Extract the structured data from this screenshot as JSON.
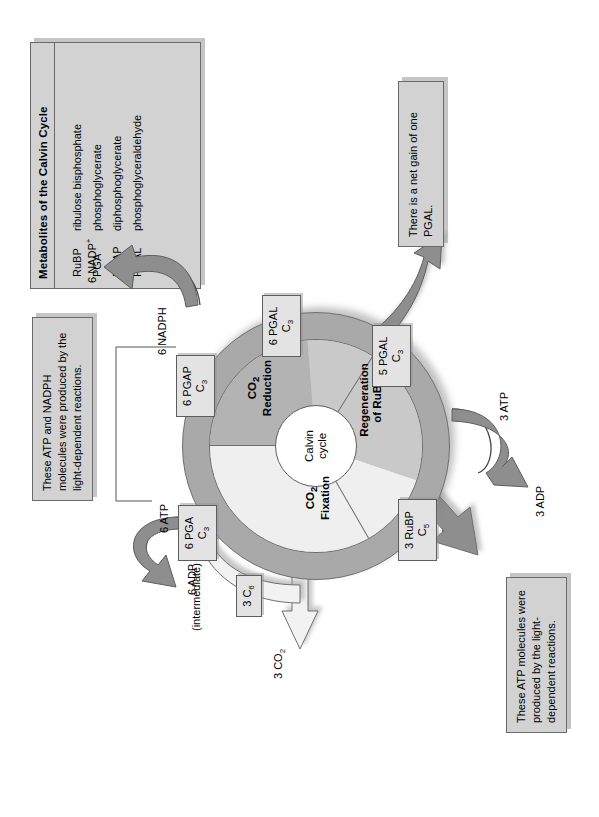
{
  "figure": {
    "kind": "calvin-cycle-diagram",
    "hub_line1": "Calvin",
    "hub_line2": "cycle"
  },
  "legend": {
    "title": "Metabolites of the Calvin Cycle",
    "rows": [
      {
        "abbr": "RuBP",
        "name": "ribulose bisphosphate"
      },
      {
        "abbr": "PGA",
        "name": "phosphoglycerate"
      },
      {
        "abbr": "PGAP",
        "name": "diphosphoglycerate"
      },
      {
        "abbr": "PGAL",
        "name": "phosphoglyceraldehyde"
      }
    ]
  },
  "wedges": {
    "fixation_l1": "CO",
    "fixation_sub": "2",
    "fixation_l2": "Fixation",
    "reduction_l1": "CO",
    "reduction_sub": "2",
    "reduction_l2": "Reduction",
    "regeneration_l1": "Regeneration",
    "regeneration_l2": "of RuBP"
  },
  "boxes": {
    "pga": {
      "line1": "6 PGA",
      "line2": "C",
      "sub": "3"
    },
    "pgap": {
      "line1": "6 PGAP",
      "line2": "C",
      "sub": "3"
    },
    "pgal6": {
      "line1": "6 PGAL",
      "line2": "C",
      "sub": "3"
    },
    "pgal5": {
      "line1": "5 PGAL",
      "line2": "C",
      "sub": "3"
    },
    "rubp": {
      "line1": "3 RuBP",
      "line2": "C",
      "sub": "5"
    },
    "c6": {
      "line1": "3 C",
      "sub": "6"
    }
  },
  "labels": {
    "intermediate": "(intermediate)",
    "co2_in": "3 CO",
    "co2_in_sub": "2",
    "atp6": "6 ATP",
    "adp6": "6 ADP",
    "nadph6": "6 NADPH",
    "nadp6": "6 NADP",
    "nadp6_sup": "+",
    "atp3": "3 ATP",
    "adp3": "3 ADP"
  },
  "notes": {
    "top": "These ATP and NADPH molecules were produced by the light-dependent reactions.",
    "bottom": "These ATP molecules were produced by the light-dependent reactions.",
    "netgain": "There is a net gain of one PGAL."
  },
  "colors": {
    "ring": "#a9a9a9",
    "wedge_fixation": "#efefef",
    "wedge_reduction": "#b3b3b3",
    "wedge_regeneration": "#c9c9c9",
    "box_fill": "#e3e3e3",
    "note_fill": "#d2d2d2",
    "arrow_dark": "#8e8e8e",
    "arrow_light": "#f2f2f2",
    "stroke": "#5d5d5d"
  }
}
